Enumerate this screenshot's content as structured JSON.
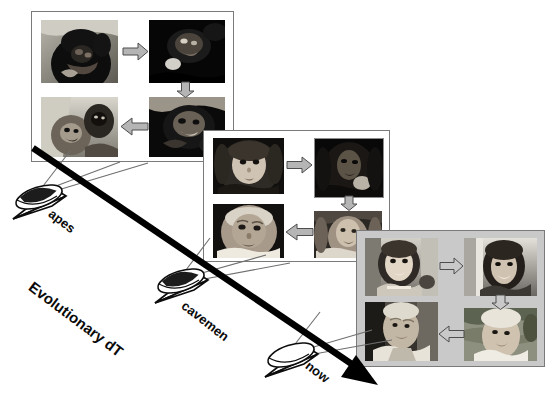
{
  "figure": {
    "title_label": "Evolutionary dT",
    "type": "diagram",
    "background_color": "#ffffff",
    "axis": {
      "label": "Evolutionary dT",
      "direction": "down-right",
      "arrow_color": "#000000",
      "start": [
        33,
        148
      ],
      "end": [
        375,
        382
      ]
    },
    "viewpoints": [
      {
        "id": "apes",
        "label": "apes",
        "x": 10,
        "y": 178,
        "label_x": 55,
        "label_y": 208
      },
      {
        "id": "cavemen",
        "label": "cavemen",
        "x": 152,
        "y": 262,
        "label_x": 188,
        "label_y": 300
      },
      {
        "id": "now",
        "label": "now",
        "x": 262,
        "y": 336,
        "label_x": 312,
        "label_y": 360
      }
    ],
    "panels": [
      {
        "id": "panel-apes",
        "viewpoint": "apes",
        "x": 31,
        "y": 11,
        "width": 203,
        "height": 151,
        "background_color": "#ffffff",
        "border_color": "#7a7a7a",
        "cells": [
          {
            "id": "ape-infant",
            "caption": "ape infant",
            "position": "top-left"
          },
          {
            "id": "ape-juvenile",
            "caption": "ape juvenile",
            "position": "top-right"
          },
          {
            "id": "ape-adult",
            "caption": "ape adult",
            "position": "bottom-right"
          },
          {
            "id": "ape-elder",
            "caption": "ape elder w/ young",
            "position": "bottom-left"
          }
        ],
        "arrows": [
          "right",
          "down",
          "left"
        ]
      },
      {
        "id": "panel-cavemen",
        "viewpoint": "cavemen",
        "x": 203,
        "y": 130,
        "width": 187,
        "height": 132,
        "background_color": "#ffffff",
        "border_color": "#7a7a7a",
        "cells": [
          {
            "id": "caveman-child",
            "caption": "child",
            "position": "top-left"
          },
          {
            "id": "caveman-youth",
            "caption": "youth",
            "position": "top-right"
          },
          {
            "id": "caveman-adult",
            "caption": "adult",
            "position": "bottom-right"
          },
          {
            "id": "caveman-elder",
            "caption": "elder",
            "position": "bottom-left"
          }
        ],
        "arrows": [
          "right",
          "down",
          "left"
        ]
      },
      {
        "id": "panel-now",
        "viewpoint": "now",
        "x": 356,
        "y": 230,
        "width": 189,
        "height": 137,
        "background_color": "#c9c9c9",
        "border_color": "#7a7a7a",
        "cells": [
          {
            "id": "modern-girl",
            "caption": "girl",
            "position": "top-left"
          },
          {
            "id": "modern-woman",
            "caption": "young woman",
            "position": "top-right"
          },
          {
            "id": "modern-mature",
            "caption": "mature woman",
            "position": "bottom-right"
          },
          {
            "id": "modern-elder",
            "caption": "elderly man",
            "position": "bottom-left"
          }
        ],
        "arrows": [
          "right",
          "down",
          "left"
        ]
      }
    ],
    "colors": {
      "arrow_fill": "#b5b5b5",
      "arrow_stroke": "#4d4d4d",
      "axis": "#000000",
      "sight_line": "#6f6f6f",
      "cone_fill": "#ffffff",
      "cone_disc": "#9a9a9a"
    }
  }
}
